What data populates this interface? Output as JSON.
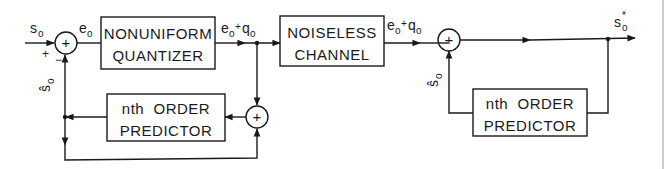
{
  "diagram": {
    "type": "block-diagram",
    "colors": {
      "ink": "#1a1a1a",
      "background": "#ffffff"
    },
    "blocks": {
      "quantizer": {
        "line1": "NONUNIFORM",
        "line2": "QUANTIZER"
      },
      "channel": {
        "line1": "NOISELESS",
        "line2": "CHANNEL"
      },
      "enc_predictor": {
        "line1": "nth  ORDER",
        "line2": "PREDICTOR"
      },
      "dec_predictor": {
        "line1": "nth  ORDER",
        "line2": "PREDICTOR"
      }
    },
    "summers": {
      "input_sum": {
        "symbol": "+",
        "plus_sign": "+",
        "minus_sign": "−"
      },
      "feedback_sum": {
        "symbol": "+"
      },
      "decoder_sum": {
        "symbol": "+"
      }
    },
    "signals": {
      "input": {
        "base": "s",
        "sub": "o"
      },
      "error": {
        "base": "e",
        "sub": "o"
      },
      "quantized": {
        "e": "e",
        "e_sub": "o",
        "plus": "+",
        "q": "q",
        "q_sub": "o"
      },
      "channel_out": {
        "e": "e",
        "e_sub": "o",
        "plus": "+",
        "q": "q",
        "q_sub": "o"
      },
      "enc_prediction": {
        "base": "ŝ",
        "sub": "o"
      },
      "dec_prediction": {
        "base": "ŝ",
        "sub": "o"
      },
      "output": {
        "base": "s",
        "sub": "o",
        "sup": "*"
      }
    }
  }
}
